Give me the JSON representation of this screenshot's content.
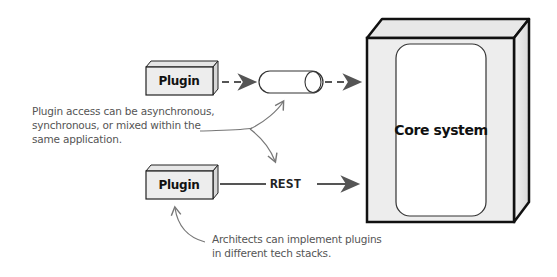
{
  "diagram": {
    "plugins": [
      {
        "label": "Plugin",
        "connection": "asynchronous"
      },
      {
        "label": "Plugin",
        "connection": "REST"
      }
    ],
    "connection_labels": {
      "rest": "REST"
    },
    "core": {
      "label": "Core system"
    },
    "notes": {
      "access": [
        "Plugin access can be asynchronous,",
        "synchronous, or mixed within the",
        "same application."
      ],
      "tech": [
        "Architects can implement plugins",
        "in different tech stacks."
      ]
    },
    "colors": {
      "box_fill": "#ececec",
      "outline": "#111111",
      "arrow": "#555555",
      "note_text": "#555555"
    }
  }
}
